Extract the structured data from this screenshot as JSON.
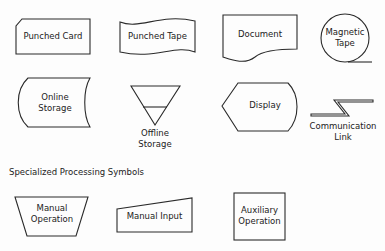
{
  "symbols": {
    "punched_card": {
      "label": "Punched Card"
    },
    "punched_tape": {
      "label": "Punched Tape"
    },
    "document": {
      "label": "Document"
    },
    "magnetic_tape": {
      "line1": "Magnetic",
      "line2": "Tape"
    },
    "online_storage": {
      "line1": "Online",
      "line2": "Storage"
    },
    "offline_storage": {
      "line1": "Offline",
      "line2": "Storage"
    },
    "display": {
      "label": "Display"
    },
    "communication_link": {
      "line1": "Communication",
      "line2": "Link"
    }
  },
  "section": {
    "heading": "Specialized Processing Symbols"
  },
  "processing": {
    "manual_operation": {
      "line1": "Manual",
      "line2": "Operation"
    },
    "manual_input": {
      "label": "Manual Input"
    },
    "auxiliary_operation": {
      "line1": "Auxiliary",
      "line2": "Operation"
    }
  },
  "colors": {
    "stroke": "#2a2a2a",
    "background": "#fdfdfd"
  }
}
